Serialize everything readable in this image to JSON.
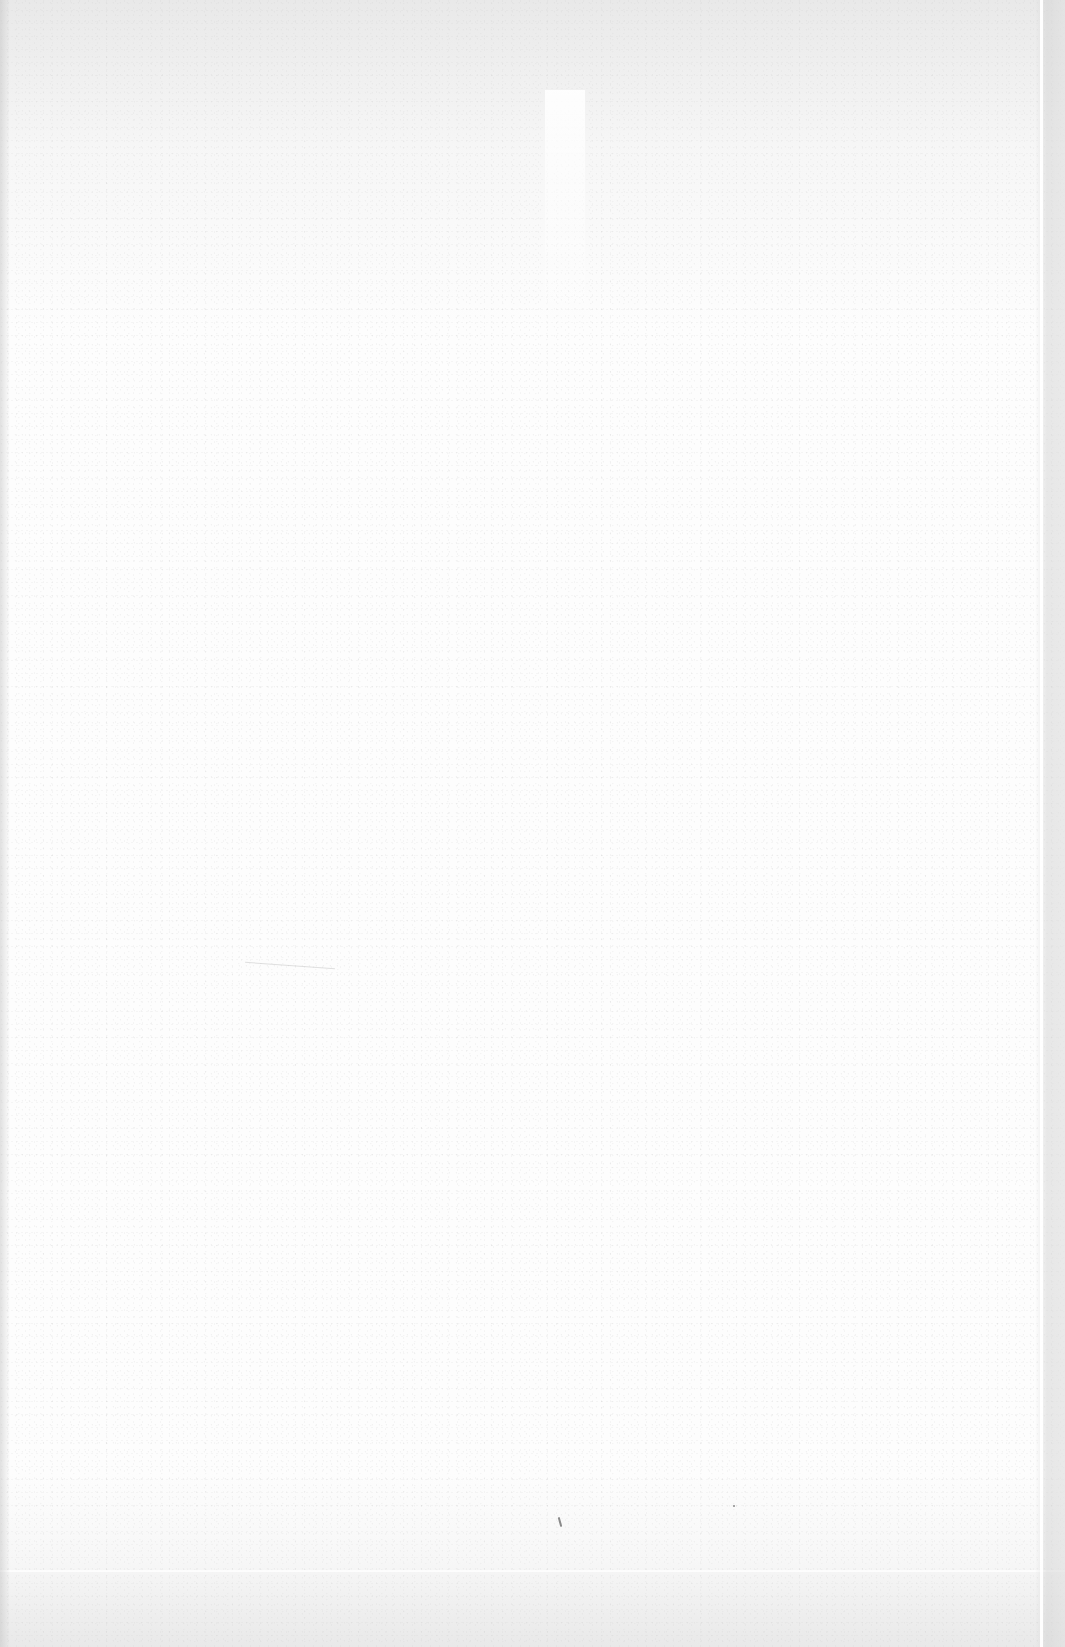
{
  "page": {
    "type": "scanned-blank-page",
    "content_text": [],
    "colors": {
      "paper": "#fdfdfd",
      "shadow_band": "#c8c8c8",
      "speck": "#8a8a8a"
    }
  }
}
